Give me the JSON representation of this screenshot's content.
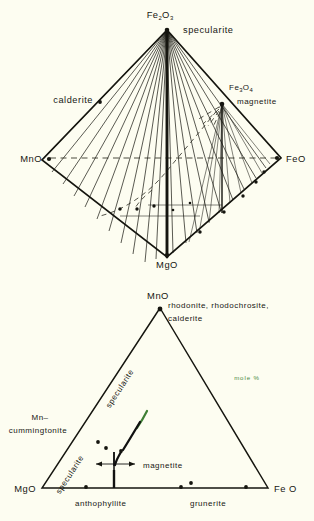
{
  "page": {
    "background_color": "#fdfdf1",
    "ink_color": "#15150f",
    "accent_color": "#3f7f35"
  },
  "figures": [
    {
      "id": "tetrahedron",
      "name": "composition-tetrahedron",
      "vertices": {
        "top": "Fe₂O₃",
        "top_mineral": "specularite",
        "left": "MnO",
        "right": "FeO",
        "bottom": "MgO",
        "interior_point": "Fe₃O₄",
        "interior_point_mineral": "magnetite",
        "left_edge_point": "calderite"
      },
      "labels": [
        {
          "key": "fe2o3",
          "text": "Fe2O3",
          "display": "Fe₂O₃"
        },
        {
          "key": "specularite",
          "text": "specularite",
          "display": "specularite"
        },
        {
          "key": "calderite",
          "text": "calderite",
          "display": "calderite"
        },
        {
          "key": "mno",
          "text": "MnO",
          "display": "MnO"
        },
        {
          "key": "feo",
          "text": "FeO",
          "display": "FeO"
        },
        {
          "key": "mgo",
          "text": "MgO",
          "display": "MgO"
        },
        {
          "key": "fe3o4",
          "text": "Fe3O4",
          "display": "Fe₃O₄"
        },
        {
          "key": "magnetite",
          "text": "magnetite",
          "display": "magnetite"
        }
      ]
    },
    {
      "id": "ternary",
      "name": "ternary-diagram",
      "vertices": {
        "apex": "MnO",
        "left": "MgO",
        "right": "Fe O"
      },
      "apex_minerals": [
        "rhodonite, rhodochrosite,",
        "calderite"
      ],
      "units_label": "mole %",
      "units_color": "#3f7f35",
      "edge_labels": {
        "left_upper": "specularite",
        "left_lower": "specularite",
        "left_outer": "Mn–\ncummingtonite",
        "left_outer_line1": "Mn–",
        "left_outer_line2": "cummingtonite"
      },
      "interior_labels": [
        "magnetite"
      ],
      "bottom_labels": [
        "anthophyllite",
        "grunerite"
      ]
    }
  ]
}
